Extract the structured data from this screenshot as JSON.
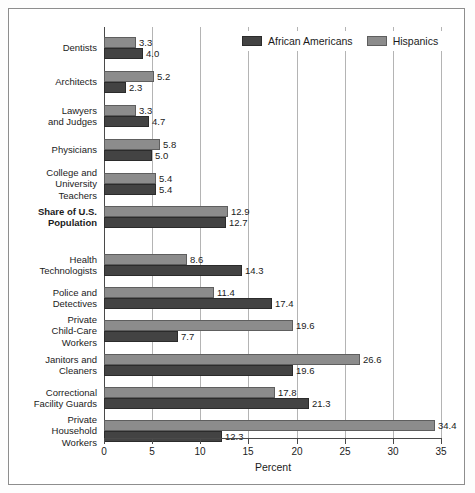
{
  "chart_data": {
    "type": "bar",
    "orientation": "horizontal",
    "title": "",
    "xlabel": "Percent",
    "ylabel": "",
    "xlim": [
      0,
      35
    ],
    "xticks": [
      0,
      5,
      10,
      15,
      20,
      25,
      30,
      35
    ],
    "grid": true,
    "legend_position": "top-right",
    "categories": [
      "Dentists",
      "Architects",
      "Lawyers\nand Judges",
      "Physicians",
      "College and\nUniversity\nTeachers",
      "Share of U.S.\nPopulation",
      "Health\nTechnologists",
      "Police and\nDetectives",
      "Private\nChild-Care\nWorkers",
      "Janitors and\nCleaners",
      "Correctional\nFacility Guards",
      "Private\nHousehold\nWorkers"
    ],
    "series": [
      {
        "name": "Hispanics",
        "color": "#8c8c8c",
        "values": [
          3.3,
          5.2,
          3.3,
          5.8,
          5.4,
          12.9,
          8.6,
          11.4,
          19.6,
          26.6,
          17.8,
          34.4
        ]
      },
      {
        "name": "African Americans",
        "color": "#434343",
        "values": [
          4.0,
          2.3,
          4.7,
          5.0,
          5.4,
          12.7,
          14.3,
          17.4,
          7.7,
          19.6,
          21.3,
          12.3
        ]
      }
    ],
    "value_labels": [
      [
        "3.3",
        "4.0"
      ],
      [
        "5.2",
        "2.3"
      ],
      [
        "3.3",
        "4.7"
      ],
      [
        "5.8",
        "5.0"
      ],
      [
        "5.4",
        "5.4"
      ],
      [
        "12.9",
        "12.7"
      ],
      [
        "8.6",
        "14.3"
      ],
      [
        "11.4",
        "17.4"
      ],
      [
        "19.6",
        "7.7"
      ],
      [
        "26.6",
        "19.6"
      ],
      [
        "17.8",
        "21.3"
      ],
      [
        "34.4",
        "12.3"
      ]
    ],
    "emphasized_category": "Share of U.S.\nPopulation"
  },
  "legend": {
    "items": [
      {
        "label": "African Americans",
        "key": "afam"
      },
      {
        "label": "Hispanics",
        "key": "hisp"
      }
    ]
  },
  "axis": {
    "xlabel": "Percent",
    "tick_labels": [
      "0",
      "5",
      "10",
      "15",
      "20",
      "25",
      "30",
      "35"
    ]
  },
  "colors": {
    "african_americans": "#434343",
    "hispanics": "#8c8c8c",
    "gridline": "#b4b4b4",
    "axis": "#4a4a4a",
    "frame": "#8d8d8d",
    "background": "#ffffff"
  }
}
